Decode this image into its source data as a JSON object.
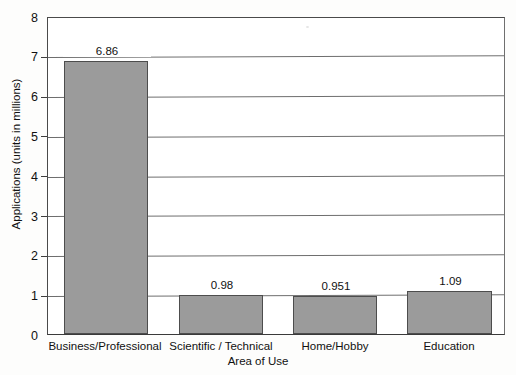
{
  "chart_data": {
    "type": "bar",
    "title": "",
    "categories": [
      "Business/Professional",
      "Scientific / Technical",
      "Home/Hobby",
      "Education"
    ],
    "values": [
      6.86,
      0.98,
      0.951,
      1.09
    ],
    "value_labels": [
      "6.86",
      "0.98",
      "0.951",
      "1.09"
    ],
    "xlabel": "Area of Use",
    "ylabel": "Applications (units in millions)",
    "ylim": [
      0,
      8
    ],
    "ytick_labels": [
      "0",
      "1",
      "2",
      "3",
      "4",
      "5",
      "6",
      "7",
      "8"
    ],
    "yticks": [
      0,
      1,
      2,
      3,
      4,
      5,
      6,
      7,
      8
    ],
    "grid": true,
    "grid_axis": "y",
    "legend": false,
    "bar_color": "#9b9b9b",
    "bar_border_color": "#4d4d4d",
    "plot_background": "#ffffff",
    "page_background": "#fdfdfc",
    "axis_color": "#3d3d3d"
  },
  "footer": {
    "caption_fragment": ""
  }
}
